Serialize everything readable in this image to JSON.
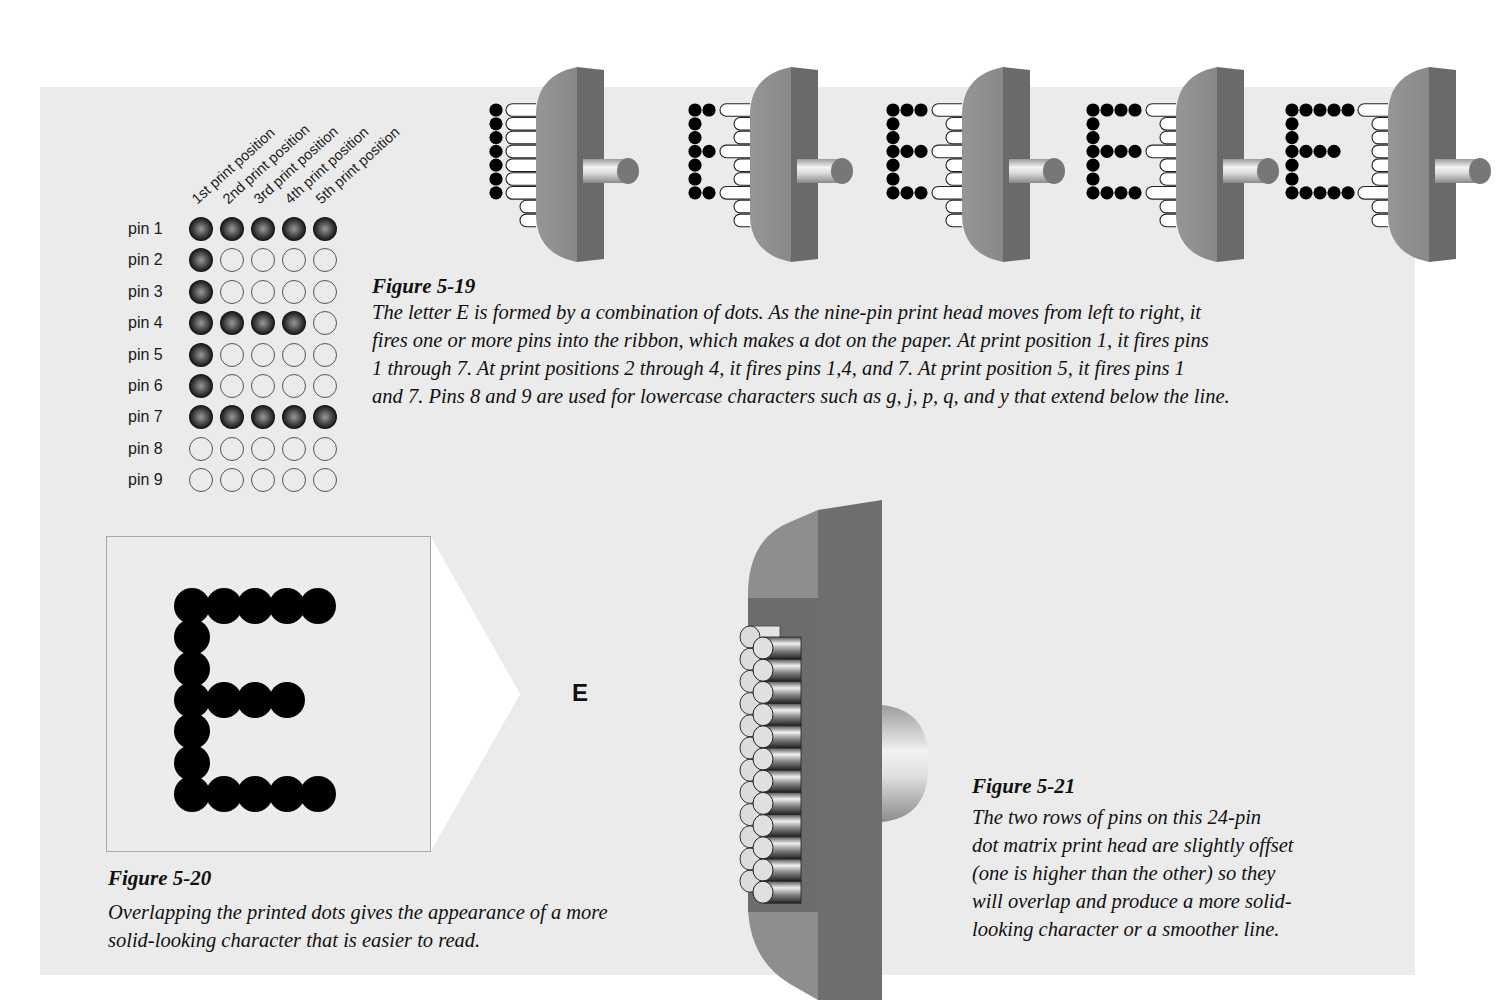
{
  "figure_5_19": {
    "position_labels": [
      "1st print position",
      "2nd print position",
      "3rd print position",
      "4th print position",
      "5th print position"
    ],
    "pin_labels": [
      "pin 1",
      "pin 2",
      "pin 3",
      "pin 4",
      "pin 5",
      "pin 6",
      "pin 7",
      "pin 8",
      "pin 9"
    ],
    "pin_matrix": [
      [
        1,
        1,
        1,
        1,
        1
      ],
      [
        1,
        0,
        0,
        0,
        0
      ],
      [
        1,
        0,
        0,
        0,
        0
      ],
      [
        1,
        1,
        1,
        1,
        0
      ],
      [
        1,
        0,
        0,
        0,
        0
      ],
      [
        1,
        0,
        0,
        0,
        0
      ],
      [
        1,
        1,
        1,
        1,
        1
      ],
      [
        0,
        0,
        0,
        0,
        0
      ],
      [
        0,
        0,
        0,
        0,
        0
      ]
    ],
    "print_head_steps": [
      {
        "columns_printed": 1,
        "fired_pins": [
          1,
          2,
          3,
          4,
          5,
          6,
          7
        ]
      },
      {
        "columns_printed": 2,
        "fired_pins": [
          1,
          4,
          7
        ]
      },
      {
        "columns_printed": 3,
        "fired_pins": [
          1,
          4,
          7
        ]
      },
      {
        "columns_printed": 4,
        "fired_pins": [
          1,
          4,
          7
        ]
      },
      {
        "columns_printed": 5,
        "fired_pins": [
          1,
          7
        ]
      }
    ],
    "title": "Figure 5-19",
    "caption_lines": [
      "The letter E is formed by a combination of dots. As the nine-pin print head moves from left to right, it",
      "fires one or more pins into the ribbon, which makes a dot on the paper. At print position 1, it fires pins",
      "1 through 7. At print positions 2 through 4, it fires pins 1,4, and 7. At print position 5, it fires pins 1",
      "and 7. Pins 8 and 9 are used for lowercase characters such as g, j, p, q, and y that extend below the line."
    ]
  },
  "figure_5_20": {
    "small_letter": "E",
    "title": "Figure 5-20",
    "caption_lines": [
      "Overlapping the printed dots gives the appearance of a more",
      "solid-looking character that is easier to read."
    ]
  },
  "figure_5_21": {
    "pins_per_row": 12,
    "rows": 2,
    "title": "Figure 5-21",
    "caption_lines": [
      "The two rows of pins on this 24-pin",
      "dot matrix print head are slightly offset",
      "(one is higher than the other) so they",
      "will overlap and produce a more solid-",
      "looking character or a smoother line."
    ]
  },
  "colors": {
    "panel_bg": "#ebebeb",
    "head_front": "#8c8c8c",
    "head_side": "#6b6b6b",
    "dot": "#000000"
  }
}
